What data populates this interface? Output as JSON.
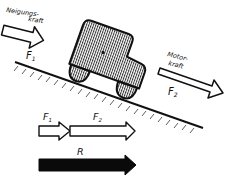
{
  "diagram": {
    "type": "force-diagram",
    "labels": {
      "incline_force": "Neigungs-",
      "incline_force_2": "kraft",
      "incline_symbol": "F",
      "incline_sub": "1",
      "motor_force": "Motor-",
      "motor_force_2": "kraft",
      "motor_symbol": "F",
      "motor_sub": "2",
      "sum_f1_symbol": "F",
      "sum_f1_sub": "1",
      "sum_f2_symbol": "F",
      "sum_f2_sub": "2",
      "resultant": "R"
    },
    "colors": {
      "ink": "#111111",
      "background": "#ffffff",
      "resultant_fill": "#0a0a0a"
    }
  }
}
